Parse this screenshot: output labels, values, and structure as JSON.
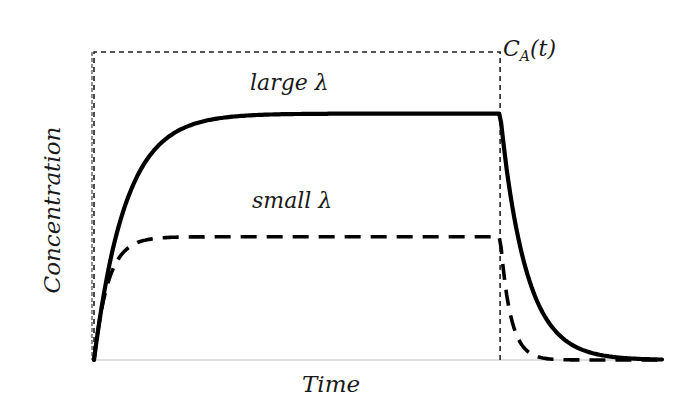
{
  "chart_data": {
    "type": "line",
    "title": "",
    "xlabel": "Time",
    "ylabel": "Concentration",
    "grid": false,
    "legend": null,
    "x_ticks": [],
    "y_ticks": [],
    "xlim": [
      0,
      1
    ],
    "ylim": [
      0,
      1
    ],
    "annotations": [
      "large λ",
      "small λ",
      "C_A(t)"
    ],
    "series": [
      {
        "name": "C_A(t)",
        "style": "thin dashed",
        "description": "rectangular input pulse",
        "x": [
          0,
          0,
          0.715,
          0.715
        ],
        "y": [
          0,
          1,
          1,
          0
        ]
      },
      {
        "name": "large λ",
        "style": "thick solid",
        "description": "exponential rise to plateau, exponential decay after pulse ends",
        "plateau": 0.8,
        "switch_off_x": 0.715,
        "x": [
          0,
          0.05,
          0.1,
          0.15,
          0.2,
          0.3,
          0.4,
          0.715,
          0.75,
          0.8,
          0.85,
          0.9,
          0.95,
          1.0
        ],
        "y": [
          0,
          0.4,
          0.62,
          0.72,
          0.77,
          0.795,
          0.8,
          0.8,
          0.52,
          0.3,
          0.16,
          0.08,
          0.03,
          0.01
        ]
      },
      {
        "name": "small λ",
        "style": "thick dashed",
        "description": "faster rise to lower plateau, faster decay after pulse ends",
        "plateau": 0.4,
        "switch_off_x": 0.715,
        "x": [
          0,
          0.03,
          0.06,
          0.1,
          0.15,
          0.25,
          0.715,
          0.74,
          0.77,
          0.8,
          0.85,
          0.9,
          1.0
        ],
        "y": [
          0,
          0.25,
          0.34,
          0.38,
          0.395,
          0.4,
          0.4,
          0.22,
          0.1,
          0.04,
          0.01,
          0.005,
          0
        ]
      }
    ]
  },
  "labels": {
    "large": "large λ",
    "small": "small λ",
    "ca_main": "C",
    "ca_sub": "A",
    "ca_arg": "(t)",
    "x_axis": "Time",
    "y_axis": "Concentration"
  }
}
